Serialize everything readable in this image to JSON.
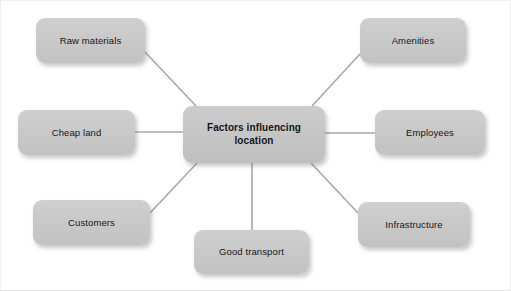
{
  "diagram": {
    "title": "Factors influencing location",
    "type": "spider-diagram",
    "center": {
      "id": "center",
      "label": "Factors influencing location",
      "label_line1": "Factors influencing",
      "label_line2": "location",
      "x": 183,
      "y": 106,
      "width": 142,
      "height": 57
    },
    "nodes": [
      {
        "id": "raw-materials",
        "label": "Raw materials",
        "x": 36,
        "y": 18,
        "width": 109,
        "height": 45
      },
      {
        "id": "amenities",
        "label": "Amenities",
        "x": 360,
        "y": 18,
        "width": 106,
        "height": 45
      },
      {
        "id": "cheap-land",
        "label": "Cheap land",
        "x": 18,
        "y": 110,
        "width": 117,
        "height": 45
      },
      {
        "id": "employees",
        "label": "Employees",
        "x": 375,
        "y": 110,
        "width": 110,
        "height": 45
      },
      {
        "id": "customers",
        "label": "Customers",
        "x": 33,
        "y": 200,
        "width": 117,
        "height": 45
      },
      {
        "id": "infrastructure",
        "label": "Infrastructure",
        "x": 358,
        "y": 202,
        "width": 112,
        "height": 45
      },
      {
        "id": "good-transport",
        "label": "Good transport",
        "x": 194,
        "y": 230,
        "width": 115,
        "height": 44
      }
    ],
    "edges": [
      {
        "from": "raw-materials",
        "to": "center",
        "x1": 145,
        "y1": 52,
        "x2": 196,
        "y2": 106
      },
      {
        "from": "amenities",
        "to": "center",
        "x1": 360,
        "y1": 54,
        "x2": 312,
        "y2": 106
      },
      {
        "from": "cheap-land",
        "to": "center",
        "x1": 135,
        "y1": 132,
        "x2": 183,
        "y2": 132
      },
      {
        "from": "employees",
        "to": "center",
        "x1": 375,
        "y1": 133,
        "x2": 325,
        "y2": 133
      },
      {
        "from": "customers",
        "to": "center",
        "x1": 150,
        "y1": 213,
        "x2": 197,
        "y2": 163
      },
      {
        "from": "infrastructure",
        "to": "center",
        "x1": 358,
        "y1": 213,
        "x2": 311,
        "y2": 163
      },
      {
        "from": "good-transport",
        "to": "center",
        "x1": 252,
        "y1": 230,
        "x2": 252,
        "y2": 163
      }
    ],
    "style": {
      "node_fill": "#c9c9c9",
      "edge_color": "#a8a8a8",
      "text_color": "#161616",
      "background": "#ffffff"
    }
  }
}
